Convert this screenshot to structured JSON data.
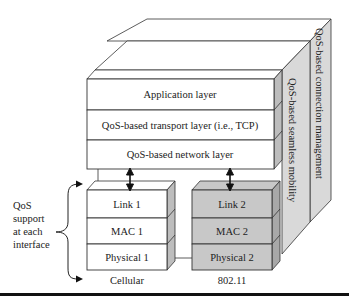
{
  "figure": {
    "upper_layers": [
      {
        "label": "Application layer"
      },
      {
        "label": "QoS-based transport layer (i.e., TCP)"
      },
      {
        "label": "QoS-based network layer"
      }
    ],
    "side_panels": {
      "inner": "QoS-based seamless mobility",
      "outer": "QoS-based connection management"
    },
    "interfaces": [
      {
        "name": "Cellular",
        "layers": [
          "Link 1",
          "MAC 1",
          "Physical 1"
        ],
        "fill": "#ffffff"
      },
      {
        "name": "802.11",
        "layers": [
          "Link 2",
          "MAC 2",
          "Physical 2"
        ],
        "fill": "#c8c8c8"
      }
    ],
    "annotation": {
      "lines": [
        "QoS",
        "support",
        "at each",
        "interface"
      ]
    },
    "colors": {
      "panel_gray": "#d9d9d9",
      "side_gray": "#bdbdbd",
      "dark_side": "#a8a8a8",
      "stroke": "#333333"
    }
  }
}
